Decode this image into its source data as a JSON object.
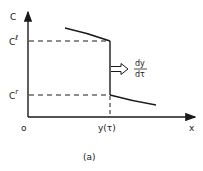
{
  "diagram": {
    "caption": "(a)",
    "y_axis_label": "C",
    "x_axis_label": "x",
    "origin_label": "o",
    "levels": {
      "upper": {
        "base": "C",
        "sup": "ℓ"
      },
      "lower": {
        "base": "C",
        "sup": "r"
      }
    },
    "jump_position_label": "y(τ)",
    "velocity_label": {
      "numerator": "dy",
      "denominator": "dτ"
    },
    "colors": {
      "ink": "#1a1a1a",
      "background": "#ffffff"
    }
  }
}
